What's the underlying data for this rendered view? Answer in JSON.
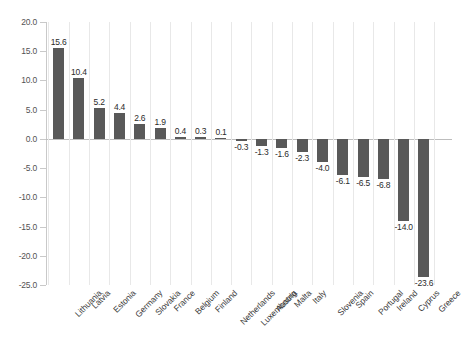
{
  "chart_data": {
    "type": "bar",
    "title": "",
    "subtitle": "",
    "xlabel": "",
    "ylabel": "",
    "ylim": [
      -25.0,
      20.0
    ],
    "grid": "vertical",
    "legend": "none",
    "orientation": "vertical",
    "bar_color": "#595959",
    "gridline_color": "#e8e8e8",
    "axis_color": "#c9c9c9",
    "ytick_labels": [
      "20.0",
      "15.0",
      "10.0",
      "5.0",
      "0.0",
      "-5.0",
      "-10.0",
      "-15.0",
      "-20.0",
      "-25.0"
    ],
    "ytick_values": [
      20.0,
      15.0,
      10.0,
      5.0,
      0.0,
      -5.0,
      -10.0,
      -15.0,
      -20.0,
      -25.0
    ],
    "categories": [
      "Lithuania",
      "Latvia",
      "Estonia",
      "Germany",
      "Slovakia",
      "France",
      "Belgium",
      "Finland",
      "Netherlands",
      "Luxembourg",
      "Austria",
      "Malta",
      "Italy",
      "Slovenia",
      "Spain",
      "Portugal",
      "Ireland",
      "Cyprus",
      "Greece"
    ],
    "values": [
      15.6,
      10.4,
      5.2,
      4.4,
      2.6,
      1.9,
      0.4,
      0.3,
      0.1,
      -0.3,
      -1.3,
      -1.6,
      -2.3,
      -4.0,
      -6.1,
      -6.5,
      -6.8,
      -14.0,
      -23.6
    ],
    "value_labels": [
      "15.6",
      "10.4",
      "5.2",
      "4.4",
      "2.6",
      "1.9",
      "0.4",
      "0.3",
      "0.1",
      "-0.3",
      "-1.3",
      "-1.6",
      "-2.3",
      "-4.0",
      "-6.1",
      "-6.5",
      "-6.8",
      "-14.0",
      "-23.6"
    ]
  },
  "caption": ""
}
